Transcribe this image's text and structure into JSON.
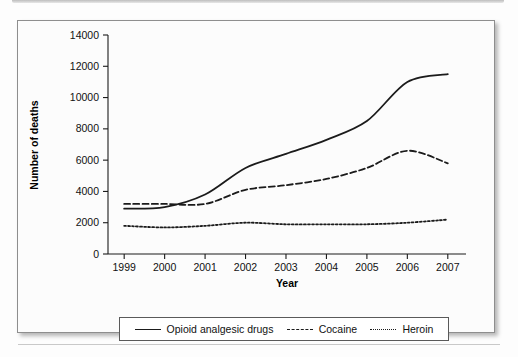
{
  "chart_data": {
    "type": "line",
    "title": "",
    "xlabel": "Year",
    "ylabel": "Number of deaths",
    "x": [
      1999,
      2000,
      2001,
      2002,
      2003,
      2004,
      2005,
      2006,
      2007
    ],
    "xticklabels": [
      "1999",
      "2000",
      "2001",
      "2002",
      "2003",
      "2004",
      "2005",
      "2006",
      "2007"
    ],
    "yticks": [
      0,
      2000,
      4000,
      6000,
      8000,
      10000,
      12000,
      14000
    ],
    "yticklabels": [
      "0",
      "2000",
      "4000",
      "6000",
      "8000",
      "10000",
      "12000",
      "14000"
    ],
    "xlim": [
      1998.6,
      2007.45
    ],
    "ylim": [
      0,
      14000
    ],
    "grid": false,
    "legend_position": "bottom",
    "line_color": "#1b1b1b",
    "series": [
      {
        "name": "Opioid analgesic drugs",
        "style": "solid",
        "values": [
          2900,
          3000,
          3800,
          5500,
          6400,
          7300,
          8500,
          11000,
          11500
        ]
      },
      {
        "name": "Cocaine",
        "style": "dashed",
        "values": [
          3200,
          3200,
          3200,
          4100,
          4400,
          4800,
          5500,
          6600,
          5800
        ]
      },
      {
        "name": "Heroin",
        "style": "dotted",
        "values": [
          1800,
          1700,
          1800,
          2000,
          1900,
          1900,
          1900,
          2000,
          2200
        ]
      }
    ]
  },
  "legend": {
    "items": [
      {
        "label": "Opioid analgesic drugs",
        "style": "solid"
      },
      {
        "label": "Cocaine",
        "style": "dashed"
      },
      {
        "label": "Heroin",
        "style": "dotted"
      }
    ]
  },
  "axes": {
    "x_title": "Year",
    "y_title": "Number of deaths"
  }
}
